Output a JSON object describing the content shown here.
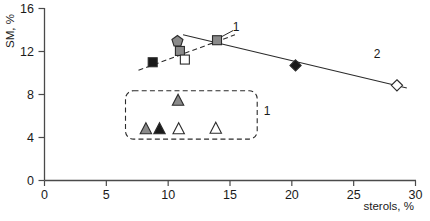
{
  "chart_data": {
    "type": "scatter",
    "title": "",
    "xlabel": "sterols, %",
    "ylabel": "SM, %",
    "xlim": [
      0,
      30
    ],
    "ylim": [
      0,
      16
    ],
    "xticks": [
      0,
      5,
      10,
      15,
      20,
      25,
      30
    ],
    "yticks": [
      0,
      4,
      8,
      12,
      16
    ],
    "xtick_labels": [
      "0",
      "5",
      "10",
      "15",
      "20",
      "25",
      "30"
    ],
    "ytick_labels": [
      "0",
      "4",
      "8",
      "12",
      "16"
    ],
    "grid": false,
    "legend": "none",
    "annotations": [
      {
        "text": "1",
        "x": 15.5,
        "y": 13.9,
        "name": "group-1-label"
      },
      {
        "text": "2",
        "x": 26.9,
        "y": 11.4,
        "name": "group-2-label"
      },
      {
        "text": "1",
        "x": 18.0,
        "y": 6.1,
        "name": "cluster-1-label"
      }
    ],
    "series": [
      {
        "name": "filled-square",
        "marker": "square",
        "fill": "#1a1a1a",
        "points": [
          {
            "x": 8.75,
            "y": 11.0
          }
        ]
      },
      {
        "name": "gray-pentagon",
        "marker": "pentagon",
        "fill": "#8a8a8a",
        "points": [
          {
            "x": 10.75,
            "y": 12.95
          }
        ]
      },
      {
        "name": "gray-square",
        "marker": "square",
        "fill": "#8a8a8a",
        "points": [
          {
            "x": 10.95,
            "y": 12.05
          },
          {
            "x": 13.95,
            "y": 13.05
          }
        ]
      },
      {
        "name": "open-square",
        "marker": "square",
        "fill": "#ffffff",
        "points": [
          {
            "x": 11.35,
            "y": 11.25
          }
        ]
      },
      {
        "name": "filled-diamond",
        "marker": "diamond",
        "fill": "#1a1a1a",
        "points": [
          {
            "x": 20.3,
            "y": 10.7
          }
        ]
      },
      {
        "name": "open-diamond",
        "marker": "diamond",
        "fill": "#ffffff",
        "points": [
          {
            "x": 28.5,
            "y": 8.85
          }
        ]
      },
      {
        "name": "gray-triangle",
        "marker": "triangle",
        "fill": "#8a8a8a",
        "points": [
          {
            "x": 10.8,
            "y": 7.45
          },
          {
            "x": 8.2,
            "y": 4.8
          }
        ]
      },
      {
        "name": "filled-triangle",
        "marker": "triangle",
        "fill": "#1a1a1a",
        "points": [
          {
            "x": 9.3,
            "y": 4.8
          }
        ]
      },
      {
        "name": "open-triangle",
        "marker": "triangle",
        "fill": "#ffffff",
        "points": [
          {
            "x": 10.85,
            "y": 4.8
          },
          {
            "x": 13.85,
            "y": 4.85
          }
        ]
      }
    ],
    "trend_lines": [
      {
        "name": "dashed-trend-line",
        "style": "dashed",
        "x1": 7.6,
        "y1": 10.25,
        "x2": 15.4,
        "y2": 13.55
      },
      {
        "name": "solid-trend-line",
        "style": "solid",
        "x1": 11.2,
        "y1": 13.55,
        "x2": 29.3,
        "y2": 8.6
      }
    ],
    "cluster_box": {
      "name": "cluster-1-box",
      "style": "dashed",
      "x1": 6.55,
      "y1": 3.85,
      "x2": 17.2,
      "y2": 8.35
    },
    "leader_line": {
      "name": "group-1-leader",
      "x1": 14.2,
      "y1": 13.3,
      "x2": 15.25,
      "y2": 13.95
    }
  },
  "axes": {
    "x_axis_name": "x-axis",
    "y_axis_name": "y-axis"
  }
}
